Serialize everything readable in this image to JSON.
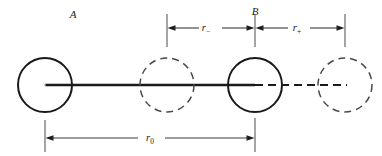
{
  "figure": {
    "title": "",
    "background_color": "#ffffff",
    "stroke_color": "#1a1a1a",
    "labels": {
      "point_a": "A",
      "point_b": "B",
      "dim_r_minus_base": "r",
      "dim_r_minus_sub": "−",
      "dim_r_plus_base": "r",
      "dim_r_plus_sub": "+",
      "dim_r_zero_base": "r",
      "dim_r_zero_sub": "0"
    },
    "atoms": [
      {
        "name": "atom-a-solid",
        "label": "A",
        "style": "solid",
        "cx": 45,
        "cy": 85,
        "r": 27
      },
      {
        "name": "atom-displaced-dashed-1",
        "label": "",
        "style": "dashed",
        "cx": 167,
        "cy": 85,
        "r": 27
      },
      {
        "name": "atom-b-solid",
        "label": "B",
        "style": "solid",
        "cx": 255,
        "cy": 85,
        "r": 27
      },
      {
        "name": "atom-displaced-dashed-2",
        "label": "",
        "style": "dashed",
        "cx": 345,
        "cy": 85,
        "r": 27
      }
    ],
    "bonds": [
      {
        "name": "bond-solid-a-to-b",
        "style": "solid",
        "x1": 45,
        "x2": 255,
        "y": 85
      },
      {
        "name": "bond-dashed-b-to-right",
        "style": "dashed",
        "x1": 255,
        "x2": 345,
        "y": 85
      }
    ],
    "dimensions": [
      {
        "name": "dimension-r-minus",
        "label": "r−",
        "from_x": 167,
        "to_x": 255,
        "y": 28,
        "extension_top": 14,
        "extension_bottom": 43
      },
      {
        "name": "dimension-r-plus",
        "label": "r+",
        "from_x": 255,
        "to_x": 345,
        "y": 28,
        "extension_top": 14,
        "extension_bottom": 43
      },
      {
        "name": "dimension-r-zero",
        "label": "r0",
        "from_x": 45,
        "to_x": 255,
        "y": 138,
        "extension_top": 120,
        "extension_bottom": 152
      }
    ]
  }
}
